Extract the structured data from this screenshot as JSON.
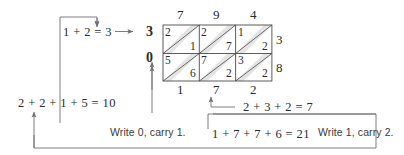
{
  "diagram": {
    "colors": {
      "line": "#6f6f6f",
      "grid": "#4a4a4a",
      "band": "#e3e3e3",
      "text": "#2b2b2b"
    },
    "grid": {
      "columns": 3,
      "rows": 2,
      "top_labels": [
        "7",
        "9",
        "4"
      ],
      "right_labels": [
        "3",
        "8"
      ],
      "bottom_labels": [
        "1",
        "7",
        "2"
      ],
      "left_labels": [
        "3",
        "0"
      ],
      "cells": [
        {
          "row": 0,
          "col": 0,
          "upper": "2",
          "lower": "1"
        },
        {
          "row": 0,
          "col": 1,
          "upper": "2",
          "lower": "7"
        },
        {
          "row": 0,
          "col": 2,
          "upper": "1",
          "lower": "2"
        },
        {
          "row": 1,
          "col": 0,
          "upper": "5",
          "lower": "6"
        },
        {
          "row": 1,
          "col": 1,
          "upper": "7",
          "lower": "2"
        },
        {
          "row": 1,
          "col": 2,
          "upper": "3",
          "lower": "2"
        }
      ]
    },
    "annotations": {
      "carry_top_left": "1 + 2 = 3",
      "carry_top_result": "3",
      "left_digit_row2": "0",
      "sum_left": "2 + 2 + 1 + 5 = 10",
      "note_write0": "Write 0, carry 1.",
      "sum_middle": "1 + 7 + 7 + 6 = 21",
      "note_write1": "Write 1, carry 2.",
      "sum_right": "2 + 3 + 2 = 7"
    }
  }
}
